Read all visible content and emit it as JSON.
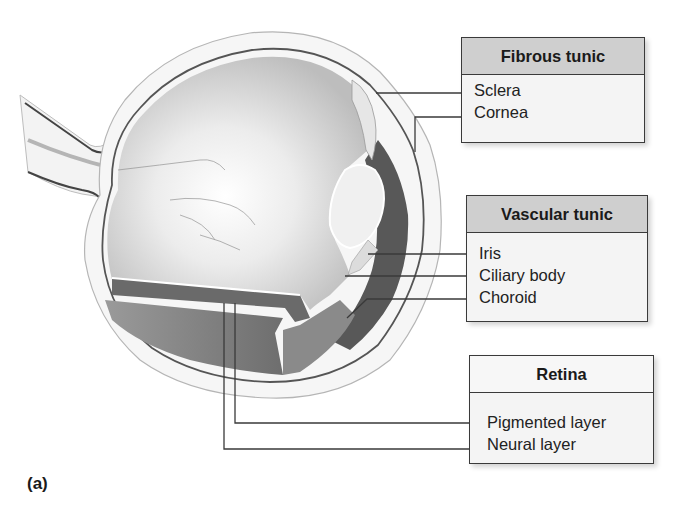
{
  "figure": {
    "label": "(a)"
  },
  "groups": [
    {
      "title": "Fibrous tunic",
      "header_style": "gray",
      "items": [
        "Sclera",
        "Cornea"
      ]
    },
    {
      "title": "Vascular tunic",
      "header_style": "gray",
      "items": [
        "Iris",
        "Ciliary body",
        "Choroid"
      ]
    },
    {
      "title": "Retina",
      "header_style": "white",
      "items": [
        "Pigmented layer",
        "Neural layer"
      ]
    }
  ],
  "colors": {
    "line": "#3a3a3a",
    "header_gray": "#cfcfcf",
    "box_fill": "#f4f4f4",
    "vitreous": "#d2d2d2",
    "choroid_dark": "#3c3c3c",
    "sclera": "#f0f0f0",
    "retina_band": "#8a8a8a"
  }
}
